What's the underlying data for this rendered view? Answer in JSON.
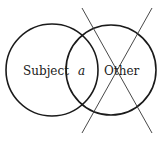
{
  "diagram": {
    "type": "venn",
    "circles": [
      {
        "label": "Subject",
        "cx": 52,
        "cy": 70,
        "r": 46
      },
      {
        "label": "Other",
        "cx": 111,
        "cy": 70,
        "r": 45
      }
    ],
    "intersection_label": "a",
    "crossed_out": "Other",
    "stroke_color": "#1a1a1a",
    "background": "#ffffff"
  }
}
